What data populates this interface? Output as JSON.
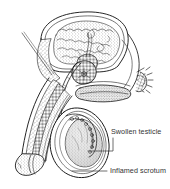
{
  "figure": {
    "background_color": "#ffffff",
    "ink_color": "#1a1a1a",
    "label_color": "#333333",
    "width": 170,
    "height": 189
  },
  "labels": [
    {
      "id": "swollen-testicle",
      "text": "Swollen testicle",
      "leader": "elbow",
      "x": 111,
      "y": 127
    },
    {
      "id": "inflamed-scrotum",
      "text": "Inflamed scrotum",
      "leader": "dash",
      "x": 110,
      "y": 166
    }
  ],
  "structures": [
    {
      "id": "bladder",
      "name": "Bladder"
    },
    {
      "id": "prostate",
      "name": "Prostate gland"
    },
    {
      "id": "seminal-vesicle",
      "name": "Seminal vesicle"
    },
    {
      "id": "vas-deferens",
      "name": "Vas deferens"
    },
    {
      "id": "urethra",
      "name": "Urethra"
    },
    {
      "id": "penis-shaft",
      "name": "Penis shaft"
    },
    {
      "id": "glans-penis",
      "name": "Glans penis"
    },
    {
      "id": "testicle",
      "name": "Testicle"
    },
    {
      "id": "epididymis",
      "name": "Epididymis"
    },
    {
      "id": "scrotum",
      "name": "Scrotum"
    },
    {
      "id": "rectum",
      "name": "Rectum"
    },
    {
      "id": "anus",
      "name": "Anus"
    }
  ]
}
